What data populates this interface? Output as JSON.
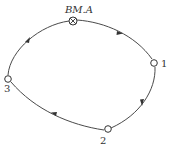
{
  "diagram": {
    "type": "closed leveling route",
    "direction": "clockwise",
    "benchmark": {
      "label": "BM.A",
      "symbol": "circle-cross-icon"
    },
    "points": [
      {
        "id": "1",
        "label": "1"
      },
      {
        "id": "2",
        "label": "2"
      },
      {
        "id": "3",
        "label": "3"
      }
    ],
    "segments": [
      {
        "from": "BM.A",
        "to": "1"
      },
      {
        "from": "1",
        "to": "2"
      },
      {
        "from": "2",
        "to": "3"
      },
      {
        "from": "3",
        "to": "BM.A"
      }
    ],
    "colors": {
      "line": "#4a4a4a",
      "text": "#333333",
      "background": "#ffffff"
    }
  }
}
